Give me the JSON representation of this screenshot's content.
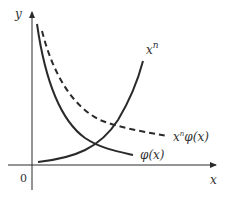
{
  "diagram": {
    "axes": {
      "x_label": "x",
      "y_label": "y",
      "origin_label": "0"
    },
    "curves": [
      {
        "name": "phi",
        "label": "φ(x)",
        "style": "solid",
        "description": "decreasing curve"
      },
      {
        "name": "xn_phi",
        "label_base": "x",
        "label_sup": "n",
        "label_rest": "φ(x)",
        "style": "dashed",
        "description": "decreasing curve above φ(x)"
      },
      {
        "name": "xn",
        "label_base": "x",
        "label_sup": "n",
        "style": "solid",
        "description": "increasing curve"
      }
    ],
    "colors": {
      "stroke": "#2a2a2a",
      "text": "#333333",
      "background": "#ffffff"
    }
  }
}
